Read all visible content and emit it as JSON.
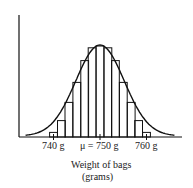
{
  "chart_data": {
    "type": "bar",
    "title": "",
    "subtitle": "",
    "xlabel": "Weight of bags",
    "xlabel_units": "(grams)",
    "ylabel": "",
    "x_ticks": [
      {
        "value": 740,
        "label": "740 g"
      },
      {
        "value": 750,
        "label": "μ = 750 g"
      },
      {
        "value": 760,
        "label": "760 g"
      }
    ],
    "mean": 750,
    "bin_width_g": 1.667,
    "categories": [
      "740",
      "741.7",
      "743.3",
      "745",
      "746.7",
      "748.3",
      "750",
      "751.7",
      "753.3",
      "755",
      "756.7",
      "758.3",
      "760"
    ],
    "values": [
      0.05,
      0.18,
      0.38,
      0.6,
      0.84,
      0.98,
      1.0,
      0.98,
      0.84,
      0.6,
      0.38,
      0.18,
      0.05
    ],
    "xlim": [
      733,
      767
    ],
    "ylim": [
      0,
      1.05
    ],
    "grid": false,
    "legend": null,
    "curve": "normal density overlay"
  }
}
